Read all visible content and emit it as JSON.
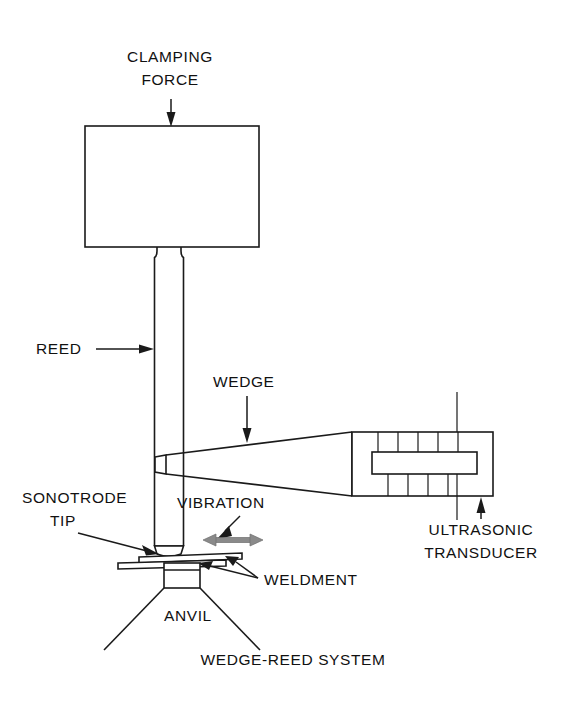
{
  "figure": {
    "caption": "WEDGE-REED SYSTEM",
    "background_color": "#ffffff",
    "line_color": "#1a1a1a",
    "vibration_arrow_color": "#8a8a8a"
  },
  "labels": {
    "clamping_force_line1": "CLAMPING",
    "clamping_force_line2": "FORCE",
    "reed": "REED",
    "wedge": "WEDGE",
    "sonotrode_tip_line1": "SONOTRODE",
    "sonotrode_tip_line2": "TIP",
    "vibration": "VIBRATION",
    "weldment": "WELDMENT",
    "anvil": "ANVIL",
    "ultrasonic_transducer_line1": "ULTRASONIC",
    "ultrasonic_transducer_line2": "TRANSDUCER"
  },
  "components": [
    {
      "name": "clamping-head-block",
      "label": "Clamping head block"
    },
    {
      "name": "reed-column",
      "label": "REED"
    },
    {
      "name": "wedge-body",
      "label": "WEDGE"
    },
    {
      "name": "ultrasonic-transducer-body",
      "label": "ULTRASONIC TRANSDUCER"
    },
    {
      "name": "sonotrode-tip",
      "label": "SONOTRODE TIP"
    },
    {
      "name": "weldment-plates",
      "label": "WELDMENT"
    },
    {
      "name": "anvil-block",
      "label": "ANVIL"
    },
    {
      "name": "vibration-arrow",
      "label": "VIBRATION"
    }
  ]
}
